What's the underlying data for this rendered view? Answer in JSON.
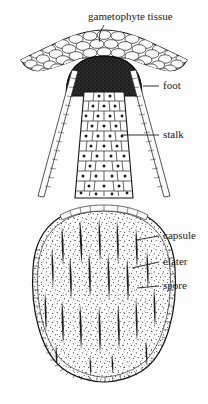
{
  "figure": {
    "background_color": "#fdfdfd",
    "ink_color": "#151515",
    "width": 208,
    "height": 404
  },
  "labels": [
    {
      "id": "gametophyte-tissue",
      "text": "gametophyte tissue",
      "text_x": 88,
      "text_y": 17,
      "anchor": "start",
      "leader": "M 104 25 C 100 32, 98 36, 100 42"
    },
    {
      "id": "foot",
      "text": "foot",
      "text_x": 163,
      "text_y": 86,
      "anchor": "start",
      "leader": "M 143 86 L 159 86"
    },
    {
      "id": "stalk",
      "text": "stalk",
      "text_x": 163,
      "text_y": 135,
      "anchor": "start",
      "leader": "M 122 135 L 159 135"
    },
    {
      "id": "capsule",
      "text": "capsule",
      "text_x": 163,
      "text_y": 236,
      "anchor": "start",
      "leader": "M 136 240 L 159 236"
    },
    {
      "id": "elater",
      "text": "elater",
      "text_x": 163,
      "text_y": 262,
      "anchor": "start",
      "leader": "M 132 268 L 159 262"
    },
    {
      "id": "spore",
      "text": "spore",
      "text_x": 163,
      "text_y": 286,
      "anchor": "start",
      "leader": "M 137 288 L 159 286"
    }
  ],
  "structures": {
    "gametophyte": {
      "name": "gametophyte tissue",
      "description": "multi-layered canopy of rounded cells with drooping lateral wings",
      "cell_fill": "#f2f2f2"
    },
    "foot": {
      "name": "foot",
      "description": "dark densely packed dome of small cells anchoring the sporophyte",
      "fill": "#262626"
    },
    "stalk": {
      "name": "stalk",
      "description": "column of polygonal cells each with a dark central nucleus, widening downward"
    },
    "calyptra_strands": {
      "name": "calyptra strands",
      "description": "two thin diagonal cellular strands flanking the stalk"
    },
    "capsule": {
      "name": "capsule",
      "description": "elongate ovoid sporangium with beaded cellular wall, rounded base"
    },
    "elaters": {
      "name": "elaters",
      "description": "dark tapered spindle-shaped strands within the capsule"
    },
    "spores": {
      "name": "spores",
      "description": "fine dark stipple filling the capsule interior"
    }
  }
}
